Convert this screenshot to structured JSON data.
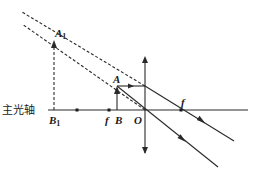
{
  "diagram": {
    "type": "convex-lens-virtual-image-ray-diagram",
    "labels": {
      "axis": "主光轴",
      "image_top": "A",
      "image_top_sub": "1",
      "image_bottom": "B",
      "image_bottom_sub": "1",
      "object_top": "A",
      "object_bottom": "B",
      "focal_left": "f",
      "focal_right": "f",
      "optical_center": "O"
    },
    "elements": {
      "principal_axis": {
        "x1": 48,
        "y1": 110,
        "x2": 248,
        "y2": 110
      },
      "lens": {
        "x": 145,
        "y_top": 60,
        "y_bottom": 155,
        "kind": "convex"
      },
      "object": {
        "x": 117,
        "y_base": 110,
        "y_top": 86
      },
      "virtual_image": {
        "x": 54,
        "y_base": 110,
        "y_top": 40
      },
      "focal_points": [
        {
          "x": 109,
          "y": 110
        },
        {
          "x": 181,
          "y": 110
        }
      ],
      "double_focal_point": {
        "x": 77,
        "y": 110
      },
      "rays": [
        {
          "name": "parallel-ray",
          "path": [
            [
              117,
              86
            ],
            [
              145,
              86
            ],
            [
              234,
              141
            ]
          ]
        },
        {
          "name": "center-ray",
          "path": [
            [
              117,
              86
            ],
            [
              145,
              110
            ],
            [
              218,
              167
            ]
          ]
        }
      ],
      "virtual_extensions": [
        {
          "name": "parallel-ray-extension",
          "from": [
            145,
            86
          ],
          "to": [
            22,
            12
          ]
        },
        {
          "name": "center-ray-extension",
          "from": [
            145,
            110
          ],
          "to": [
            22,
            24
          ]
        }
      ]
    },
    "colors": {
      "line": "#2a2a2a",
      "text": "#1a1a1a",
      "background": "#ffffff"
    }
  }
}
